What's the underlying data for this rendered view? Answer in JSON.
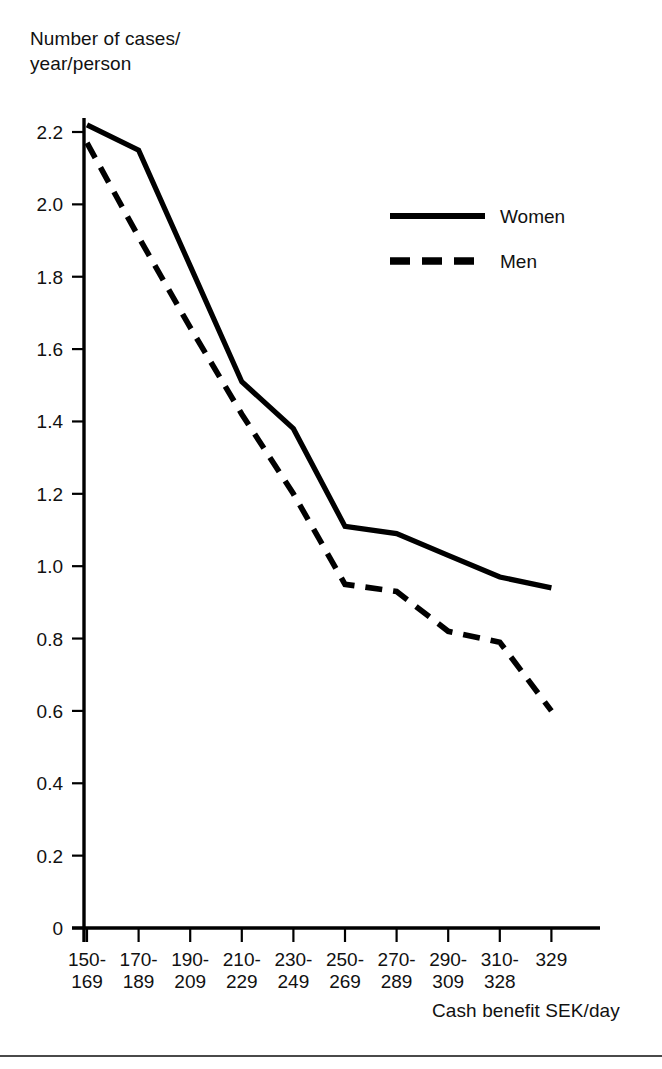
{
  "chart_data": {
    "type": "line",
    "title": "",
    "ylabel": "Number of cases/\nyear/person",
    "xlabel": "Cash benefit SEK/day",
    "categories": [
      "150-\n169",
      "170-\n189",
      "190-\n209",
      "210-\n229",
      "230-\n249",
      "250-\n269",
      "270-\n289",
      "290-\n309",
      "310-\n328",
      "329"
    ],
    "category_labels_flat": [
      "150-169",
      "170-189",
      "190-209",
      "210-229",
      "230-249",
      "250-269",
      "270-289",
      "290-309",
      "310-328",
      "329"
    ],
    "ylim": [
      0,
      2.3
    ],
    "yticks": [
      "0",
      "0.2",
      "0.4",
      "0.6",
      "0.8",
      "1.0",
      "1.2",
      "1.4",
      "1.6",
      "1.8",
      "2.0",
      "2.2"
    ],
    "ytick_values": [
      0,
      0.2,
      0.4,
      0.6,
      0.8,
      1.0,
      1.2,
      1.4,
      1.6,
      1.8,
      2.0,
      2.2
    ],
    "grid": false,
    "legend_position": "upper-right-inside",
    "series": [
      {
        "name": "Women",
        "style": "solid",
        "color": "#000000",
        "values": [
          2.22,
          2.15,
          1.83,
          1.51,
          1.38,
          1.11,
          1.09,
          1.03,
          0.97,
          0.94
        ]
      },
      {
        "name": "Men",
        "style": "dashed",
        "color": "#000000",
        "values": [
          2.17,
          1.91,
          1.66,
          1.42,
          1.2,
          0.95,
          0.93,
          0.82,
          0.79,
          0.6
        ]
      }
    ]
  },
  "legend": {
    "items": [
      {
        "label": "Women",
        "style": "solid"
      },
      {
        "label": "Men",
        "style": "dashed"
      }
    ]
  },
  "axes": {
    "y_title": "Number of cases/\nyear/person",
    "x_title": "Cash benefit SEK/day"
  }
}
